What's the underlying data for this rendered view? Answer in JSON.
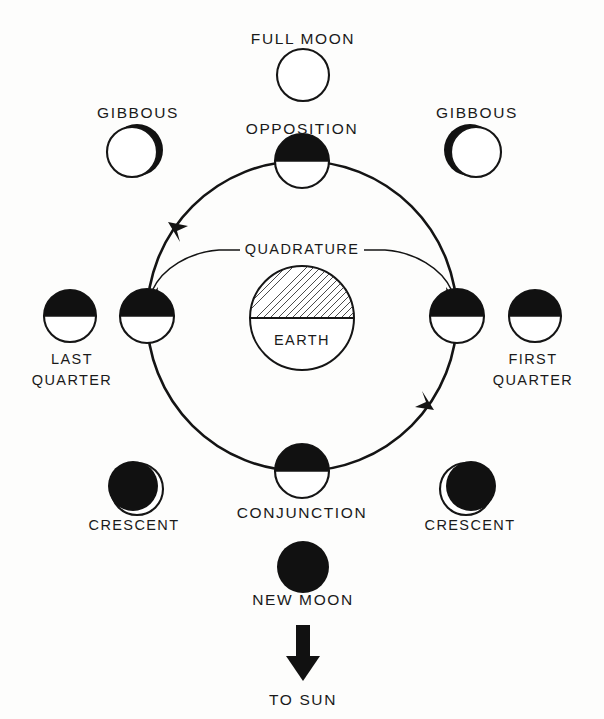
{
  "diagram": {
    "background_color": "#fdfdfc",
    "ink_color": "#141414",
    "labels": {
      "full_moon": "FULL MOON",
      "opposition": "OPPOSITION",
      "gibbous_left": "GIBBOUS",
      "gibbous_right": "GIBBOUS",
      "quadrature": "QUADRATURE",
      "earth": "EARTH",
      "last_quarter_line1": "LAST",
      "last_quarter_line2": "QUARTER",
      "first_quarter_line1": "FIRST",
      "first_quarter_line2": "QUARTER",
      "crescent_left": "CRESCENT",
      "crescent_right": "CRESCENT",
      "conjunction": "CONJUNCTION",
      "new_moon": "NEW MOON",
      "to_sun": "TO SUN"
    },
    "orbit": {
      "center_x": 302,
      "center_y": 316,
      "radius_x": 155,
      "radius_y": 155,
      "direction": "counterclockwise",
      "arrow_count": 2
    },
    "earth": {
      "center_x": 302,
      "center_y": 318,
      "radius": 52,
      "shading": "hatched-upper-half",
      "hatch_angle_deg": 45
    },
    "phase_moons_on_orbit": [
      {
        "name": "opposition",
        "x": 302,
        "y": 161,
        "r": 27,
        "phase": "dark-top-half"
      },
      {
        "name": "last-quarter-orbit",
        "x": 147,
        "y": 316,
        "r": 27,
        "phase": "dark-top-half"
      },
      {
        "name": "first-quarter-orbit",
        "x": 457,
        "y": 316,
        "r": 27,
        "phase": "dark-top-half"
      },
      {
        "name": "conjunction",
        "x": 302,
        "y": 471,
        "r": 27,
        "phase": "dark-top-half"
      }
    ],
    "phase_moons_outer": [
      {
        "name": "full-moon",
        "x": 303,
        "y": 75,
        "r": 26,
        "phase": "fully-lit"
      },
      {
        "name": "gibbous-left",
        "x": 137,
        "y": 150,
        "r": 26,
        "phase": "gibbous-waning-sliver-right"
      },
      {
        "name": "gibbous-right",
        "x": 473,
        "y": 150,
        "r": 26,
        "phase": "gibbous-waxing-sliver-left"
      },
      {
        "name": "last-quarter",
        "x": 70,
        "y": 316,
        "r": 26,
        "phase": "dark-top-half"
      },
      {
        "name": "first-quarter",
        "x": 535,
        "y": 316,
        "r": 26,
        "phase": "dark-top-half"
      },
      {
        "name": "crescent-left",
        "x": 133,
        "y": 487,
        "r": 26,
        "phase": "crescent-sliver-lower-right"
      },
      {
        "name": "crescent-right",
        "x": 470,
        "y": 487,
        "r": 26,
        "phase": "crescent-sliver-lower-left"
      },
      {
        "name": "new-moon",
        "x": 303,
        "y": 567,
        "r": 26,
        "phase": "fully-dark"
      }
    ],
    "sun_arrow": {
      "direction": "down",
      "x": 303,
      "top_y": 625,
      "bottom_y": 678
    }
  }
}
